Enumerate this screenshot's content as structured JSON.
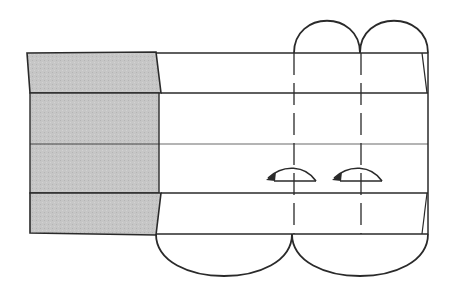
{
  "diagram": {
    "colors": {
      "background": "#ffffff",
      "stroke": "#2a2a2a",
      "shaded_paper": "#c4c4c4"
    },
    "elements": {
      "shaded_panel": "colored side of paper (left)",
      "bands": 4,
      "top_flaps": 2,
      "bottom_flaps": 2,
      "valley_fold_lines": 2,
      "fold_arrows": 2
    }
  }
}
